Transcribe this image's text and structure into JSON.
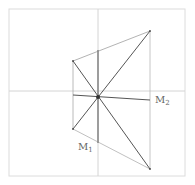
{
  "diagram": {
    "frame": {
      "x1": 9,
      "y1": 9,
      "x2": 185,
      "y2": 176,
      "color": "#d8d8d8"
    },
    "axes": {
      "vertical": {
        "x": 98,
        "y1": 9,
        "y2": 176,
        "color": "#d0d0d0"
      },
      "horizontal": {
        "y": 91,
        "x1": 9,
        "x2": 185,
        "color": "#d0d0d0"
      }
    },
    "center": {
      "x": 98,
      "y": 97
    },
    "vertices": {
      "top_right": {
        "x": 150,
        "y": 31
      },
      "bottom_right": {
        "x": 150,
        "y": 169
      },
      "left_top": {
        "x": 73,
        "y": 61
      },
      "left_bottom": {
        "x": 73,
        "y": 129
      }
    },
    "line_color": "#555555",
    "thin_color": "#9a9a9a",
    "labels": {
      "m2": {
        "base": "M",
        "sub": "2",
        "x": 155,
        "y": 103
      },
      "m1": {
        "base": "M",
        "sub": "1",
        "x": 78,
        "y": 150
      }
    }
  }
}
